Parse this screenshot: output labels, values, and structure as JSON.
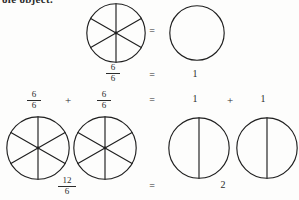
{
  "page": {
    "heading_clipped": "ole object.",
    "background_color": "#fdfdfc",
    "ink_color": "#1f1f1f"
  },
  "symbols": {
    "equals": "=",
    "plus": "+",
    "one": "1",
    "two": "2"
  },
  "rows": [
    {
      "id": "row-1",
      "label": "six-sixths-equals-one",
      "left_figure": {
        "name": "circle-six-sectors",
        "sectors": 6,
        "shaded": false,
        "divisions": [
          "vertical",
          "diagonal-right",
          "diagonal-left"
        ]
      },
      "operator": "=",
      "right_figure": {
        "name": "circle-whole",
        "sectors": 1,
        "shaded": false,
        "divisions": []
      },
      "equation": {
        "left_fraction": {
          "numerator": "6",
          "denominator": "6"
        },
        "operator": "=",
        "right_value": "1"
      }
    },
    {
      "id": "row-2",
      "label": "twelve-sixths-equals-two",
      "equation_top": {
        "term_1": {
          "numerator": "6",
          "denominator": "6"
        },
        "operator_1": "+",
        "term_2": {
          "numerator": "6",
          "denominator": "6"
        },
        "operator_2": "=",
        "term_3": "1",
        "operator_3": "+",
        "term_4": "1"
      },
      "figures": [
        {
          "name": "circle-six-sectors-a",
          "sectors": 6,
          "divisions": [
            "vertical",
            "diagonal-right",
            "diagonal-left"
          ]
        },
        {
          "name": "circle-six-sectors-b",
          "sectors": 6,
          "divisions": [
            "vertical",
            "diagonal-right",
            "diagonal-left"
          ]
        },
        {
          "name": "circle-two-halves-a",
          "sectors": 2,
          "divisions": [
            "vertical"
          ]
        },
        {
          "name": "circle-two-halves-b",
          "sectors": 2,
          "divisions": [
            "vertical"
          ]
        }
      ],
      "equation_bottom": {
        "left_fraction": {
          "numerator": "12",
          "denominator": "6"
        },
        "operator": "=",
        "right_value": "2"
      }
    }
  ]
}
